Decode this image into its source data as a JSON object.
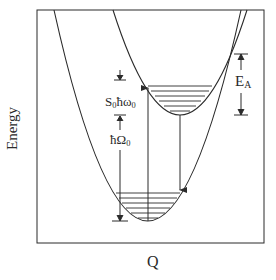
{
  "diagram": {
    "title": "",
    "axes": {
      "y_label": "Energy",
      "x_label": "Q"
    },
    "annotations": {
      "s0_label_main": "S",
      "s0_label_sub": "0",
      "s0_label_rest": "ħω",
      "s0_label_rest_sub": "0",
      "hbar_label_main": "ħΩ",
      "hbar_label_sub": "0",
      "ea_label_main": "E",
      "ea_label_sub": "A"
    },
    "colors": {
      "line": "#2a2a2a",
      "background": "#ffffff"
    },
    "wells": [
      {
        "name": "lower-parabola",
        "vibrational_levels": 6
      },
      {
        "name": "upper-parabola",
        "vibrational_levels": 6
      }
    ],
    "transitions": [
      {
        "name": "absorption-arrow",
        "direction": "up"
      },
      {
        "name": "emission-arrow",
        "direction": "down"
      }
    ]
  }
}
